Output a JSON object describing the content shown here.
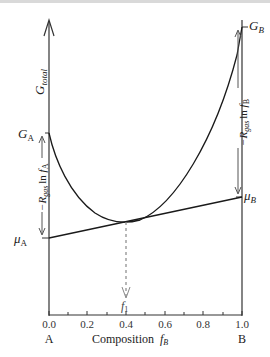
{
  "figure": {
    "y_axis_label": "G",
    "y_axis_label_sub": "total",
    "left_labels": {
      "g_a": "G",
      "g_a_sub": "A",
      "mu_a": "μ",
      "mu_a_sub": "A",
      "left_arrow_label_prefix": "−R",
      "left_arrow_label_sub": "gas",
      "left_arrow_label_mid": "ln ",
      "left_arrow_label_f": "f",
      "left_arrow_label_fsub": "A"
    },
    "right_labels": {
      "g_b": "G",
      "g_b_sub": "B",
      "mu_b": "μ",
      "mu_b_sub": "B",
      "right_arrow_label_prefix": "−R",
      "right_arrow_label_sub": "gas",
      "right_arrow_label_mid": "ln ",
      "right_arrow_label_f": "f",
      "right_arrow_label_fsub": "B"
    },
    "tangent_point_label": "f",
    "tangent_point_label_sub": "1",
    "x_ticks": [
      "0.0",
      "0.2",
      "0.4",
      "0.6",
      "0.8",
      "1.0"
    ],
    "x_axis_label": "Composition",
    "x_axis_label_var": "f",
    "x_axis_label_var_sub": "B",
    "endpoint_left": "A",
    "endpoint_right": "B",
    "colors": {
      "line": "#1a1a1a",
      "arrow": "#555555",
      "dashed": "#888888"
    }
  }
}
